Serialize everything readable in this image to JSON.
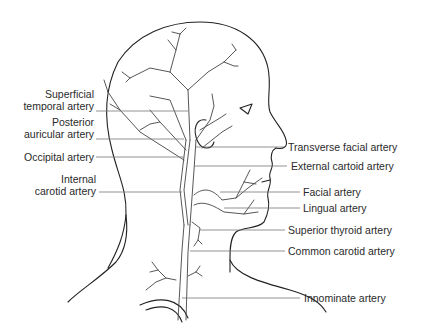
{
  "figure": {
    "labels_left": [
      {
        "id": "superficial-temporal",
        "line1": "Superficial",
        "line2": "temporal artery"
      },
      {
        "id": "posterior-auricular",
        "line1": "Posterior",
        "line2": "auricular artery"
      },
      {
        "id": "occipital",
        "line1": "Occipital artery"
      },
      {
        "id": "internal-carotid",
        "line1": "Internal",
        "line2": "carotid artery"
      }
    ],
    "labels_right": [
      {
        "id": "transverse-facial",
        "text": "Transverse facial artery"
      },
      {
        "id": "external-carotid",
        "text": "External cartoid artery"
      },
      {
        "id": "facial",
        "text": "Facial artery"
      },
      {
        "id": "lingual",
        "text": "Lingual artery"
      },
      {
        "id": "superior-thyroid",
        "text": "Superior thyroid artery"
      },
      {
        "id": "common-carotid",
        "text": "Common carotid artery"
      },
      {
        "id": "innominate",
        "text": "Innominate artery"
      }
    ],
    "colors": {
      "line": "#222222",
      "text": "#2a2a2a",
      "leader": "#777777",
      "background": "#ffffff"
    }
  }
}
